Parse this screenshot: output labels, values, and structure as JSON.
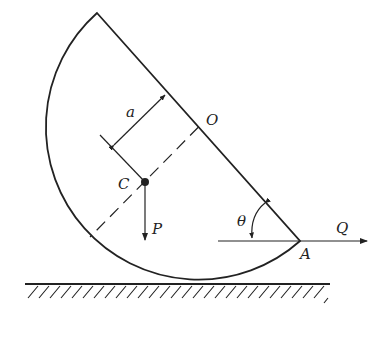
{
  "figure": {
    "labels": {
      "center": "O",
      "centroid": "C",
      "distance": "a",
      "weight": "P",
      "force": "Q",
      "point": "A",
      "angle": "θ"
    },
    "colors": {
      "stroke": "#222222",
      "background": "#ffffff"
    }
  }
}
